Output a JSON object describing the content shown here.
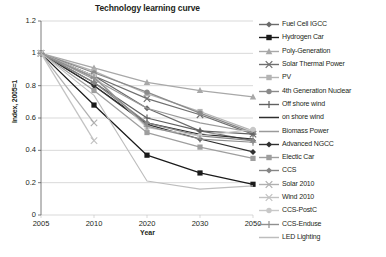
{
  "chart_data": {
    "type": "line",
    "title": "Technology learning curve",
    "xlabel": "Year",
    "ylabel": "Index, 2005=1",
    "categories": [
      "2005",
      "2010",
      "2020",
      "2030",
      "2050"
    ],
    "x": [
      2005,
      2010,
      2020,
      2030,
      2050
    ],
    "ylim": [
      0,
      1.2
    ],
    "yticks": [
      "0",
      "0.2",
      "0.4",
      "0.6",
      "0.8",
      "1",
      "1.2"
    ],
    "ytick_values": [
      0,
      0.2,
      0.4,
      0.6,
      0.8,
      1,
      1.2
    ],
    "grid": "horizontal",
    "legend_position": "right",
    "series": [
      {
        "name": "Fuel Cell IGCC",
        "marker": "diamond",
        "color": "#6b6b6b",
        "values": [
          1.0,
          0.86,
          0.66,
          0.52,
          0.46
        ]
      },
      {
        "name": "Hydrogen Car",
        "marker": "square",
        "color": "#1a1a1a",
        "values": [
          1.0,
          0.68,
          0.37,
          0.26,
          0.19
        ]
      },
      {
        "name": "Poly-Generation",
        "marker": "triangle",
        "color": "#a8a8a8",
        "values": [
          1.0,
          0.91,
          0.82,
          0.77,
          0.73
        ]
      },
      {
        "name": "Solar Thermal Power",
        "marker": "x",
        "color": "#6f6f6f",
        "values": [
          1.0,
          0.86,
          0.72,
          0.62,
          0.5
        ]
      },
      {
        "name": "PV",
        "marker": "square",
        "color": "#b4b4b4",
        "values": [
          1.0,
          0.89,
          0.75,
          0.64,
          0.52
        ]
      },
      {
        "name": "4th Generation Nuclear",
        "marker": "circle",
        "color": "#8a8a8a",
        "values": [
          1.0,
          0.88,
          0.76,
          0.63,
          0.51
        ]
      },
      {
        "name": "Off shore wind",
        "marker": "plus",
        "color": "#606060",
        "values": [
          1.0,
          0.82,
          0.6,
          0.52,
          0.5
        ]
      },
      {
        "name": "on shore wind",
        "marker": "none",
        "color": "#2e2e2e",
        "values": [
          1.0,
          0.8,
          0.57,
          0.5,
          0.47
        ]
      },
      {
        "name": "Biomass Power",
        "marker": "none",
        "color": "#9a9a9a",
        "values": [
          1.0,
          0.84,
          0.66,
          0.57,
          0.51
        ]
      },
      {
        "name": "Advanced NGCC",
        "marker": "diamond",
        "color": "#303030",
        "values": [
          1.0,
          0.8,
          0.56,
          0.47,
          0.39
        ]
      },
      {
        "name": "Electic Car",
        "marker": "square",
        "color": "#9e9e9e",
        "values": [
          1.0,
          0.77,
          0.51,
          0.42,
          0.35
        ]
      },
      {
        "name": "CCS",
        "marker": "diamond",
        "color": "#858585",
        "values": [
          1.0,
          0.82,
          0.57,
          0.49,
          0.46
        ]
      },
      {
        "name": "Solar 2010",
        "marker": "x",
        "color": "#b0b0b0",
        "values": [
          1.0,
          0.57,
          null,
          null,
          null
        ]
      },
      {
        "name": "Wind 2010",
        "marker": "x",
        "color": "#c2c2c2",
        "values": [
          1.0,
          0.46,
          null,
          null,
          null
        ]
      },
      {
        "name": "CCS-PostC",
        "marker": "circle",
        "color": "#c8c8c8",
        "values": [
          1.0,
          0.86,
          0.54,
          0.49,
          0.53
        ]
      },
      {
        "name": "CCS-Enduse",
        "marker": "plus",
        "color": "#8f8f8f",
        "values": [
          1.0,
          0.85,
          0.55,
          0.47,
          0.45
        ]
      },
      {
        "name": "LED Lighting",
        "marker": "none",
        "color": "#bdbdbd",
        "values": [
          1.0,
          0.74,
          0.21,
          0.16,
          0.18
        ]
      }
    ]
  }
}
